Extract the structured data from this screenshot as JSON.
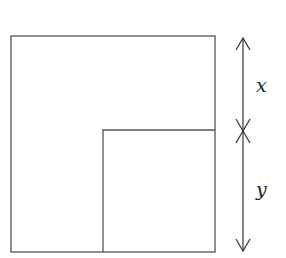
{
  "diagram": {
    "colors": {
      "stroke": "#555555",
      "arrow": "#333333",
      "text": "#222222",
      "background": "#ffffff"
    },
    "outer_square": {
      "x": 11,
      "y": 36,
      "width": 204,
      "height": 216
    },
    "inner_square": {
      "x": 103,
      "y": 130,
      "width": 112,
      "height": 122
    },
    "dimensions": [
      {
        "label": "x",
        "from_y": 38,
        "to_y": 131,
        "arrow_x": 243,
        "label_x": 262,
        "label_y": 92
      },
      {
        "label": "y",
        "from_y": 131,
        "to_y": 251,
        "arrow_x": 243,
        "label_x": 262,
        "label_y": 196
      }
    ]
  }
}
